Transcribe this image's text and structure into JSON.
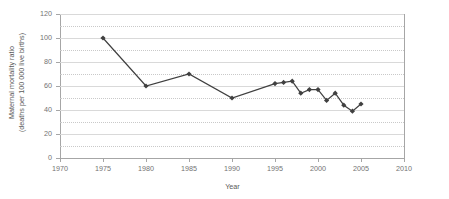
{
  "chart_data": {
    "type": "line",
    "title": "",
    "xlabel": "Year",
    "ylabel": "Maternal mortality ratio (deaths per 100 000 live births)",
    "ylabel_line1": "Maternal mortality ratio",
    "ylabel_line2": "(deaths per 100 000 live births)",
    "xlim": [
      1970,
      2010
    ],
    "ylim": [
      0,
      120
    ],
    "xticks": [
      1970,
      1975,
      1980,
      1985,
      1990,
      1995,
      2000,
      2005,
      2010
    ],
    "yticks": [
      0,
      20,
      40,
      60,
      80,
      100,
      120
    ],
    "grid": "horizontal-major-and-minor",
    "legend": "none",
    "marker": "diamond",
    "series_color": "#404040",
    "grid_color": "#d9d9d9",
    "axis_color": "#a6a6a6",
    "x": [
      1975,
      1980,
      1985,
      1990,
      1995,
      1996,
      1997,
      1998,
      1999,
      2000,
      2001,
      2002,
      2003,
      2004,
      2005
    ],
    "values": [
      100,
      60,
      70,
      50,
      62,
      63,
      64,
      54,
      57,
      57,
      48,
      54,
      44,
      39,
      45
    ],
    "series": [
      {
        "name": "Maternal mortality ratio",
        "x": [
          1975,
          1980,
          1985,
          1990,
          1995,
          1996,
          1997,
          1998,
          1999,
          2000,
          2001,
          2002,
          2003,
          2004,
          2005
        ],
        "values": [
          100,
          60,
          70,
          50,
          62,
          63,
          64,
          54,
          57,
          57,
          48,
          54,
          44,
          39,
          45
        ]
      }
    ]
  }
}
